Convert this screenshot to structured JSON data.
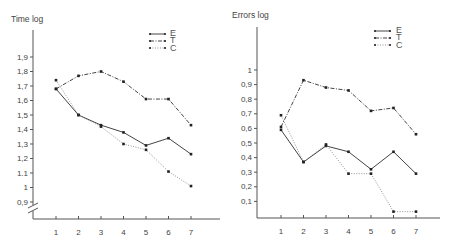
{
  "chart_data": [
    {
      "type": "line",
      "title": "Time log",
      "xlabel": "",
      "ylabel": "Time log",
      "x": [
        1,
        2,
        3,
        4,
        5,
        6,
        7
      ],
      "y_ticks": [
        "0,9",
        "1",
        "1.1",
        "1,2",
        "1,3",
        "1,4",
        "1,5",
        "1,6",
        "1,7",
        "1,8",
        "1,9"
      ],
      "y_tick_values": [
        0.9,
        1.0,
        1.1,
        1.2,
        1.3,
        1.4,
        1.5,
        1.6,
        1.7,
        1.8,
        1.9
      ],
      "ylim": [
        0.9,
        2.0
      ],
      "axis_break": true,
      "grid": false,
      "legend_position": "upper right",
      "series": [
        {
          "name": "E",
          "style": "solid",
          "values": [
            1.68,
            1.5,
            1.43,
            1.38,
            1.29,
            1.34,
            1.23
          ]
        },
        {
          "name": "T",
          "style": "dash-dot",
          "values": [
            1.68,
            1.77,
            1.8,
            1.73,
            1.61,
            1.61,
            1.43
          ]
        },
        {
          "name": "C",
          "style": "dotted",
          "values": [
            1.74,
            1.5,
            1.42,
            1.3,
            1.26,
            1.11,
            1.01
          ]
        }
      ]
    },
    {
      "type": "line",
      "title": "Errors log",
      "xlabel": "",
      "ylabel": "Errors log",
      "x": [
        1,
        2,
        3,
        4,
        5,
        6,
        7
      ],
      "y_ticks": [
        "0,1",
        "0,2",
        "0,3",
        "0,4",
        "0,5",
        "0,6",
        "0,7",
        "0,8",
        "0,9",
        "1"
      ],
      "y_tick_values": [
        0.1,
        0.2,
        0.3,
        0.4,
        0.5,
        0.6,
        0.7,
        0.8,
        0.9,
        1.0
      ],
      "ylim": [
        0,
        1.1
      ],
      "grid": false,
      "legend_position": "upper right",
      "series": [
        {
          "name": "E",
          "style": "solid",
          "values": [
            0.59,
            0.37,
            0.48,
            0.44,
            0.32,
            0.44,
            0.29
          ]
        },
        {
          "name": "T",
          "style": "dash-dot",
          "values": [
            0.61,
            0.93,
            0.88,
            0.86,
            0.72,
            0.74,
            0.56
          ]
        },
        {
          "name": "C",
          "style": "dotted",
          "values": [
            0.69,
            0.37,
            0.49,
            0.29,
            0.29,
            0.03,
            0.03
          ]
        }
      ]
    }
  ],
  "left": {
    "title": "Time log",
    "legend": [
      "E",
      "T",
      "C"
    ],
    "x_ticks": [
      "1",
      "2",
      "3",
      "4",
      "5",
      "6",
      "7"
    ]
  },
  "right": {
    "title": "Errors log",
    "legend": [
      "E",
      "T",
      "C"
    ],
    "x_ticks": [
      "1",
      "2",
      "3",
      "4",
      "5",
      "6",
      "7"
    ]
  },
  "colors": {
    "axis": "#555555",
    "line": "#444444",
    "text": "#444444"
  }
}
